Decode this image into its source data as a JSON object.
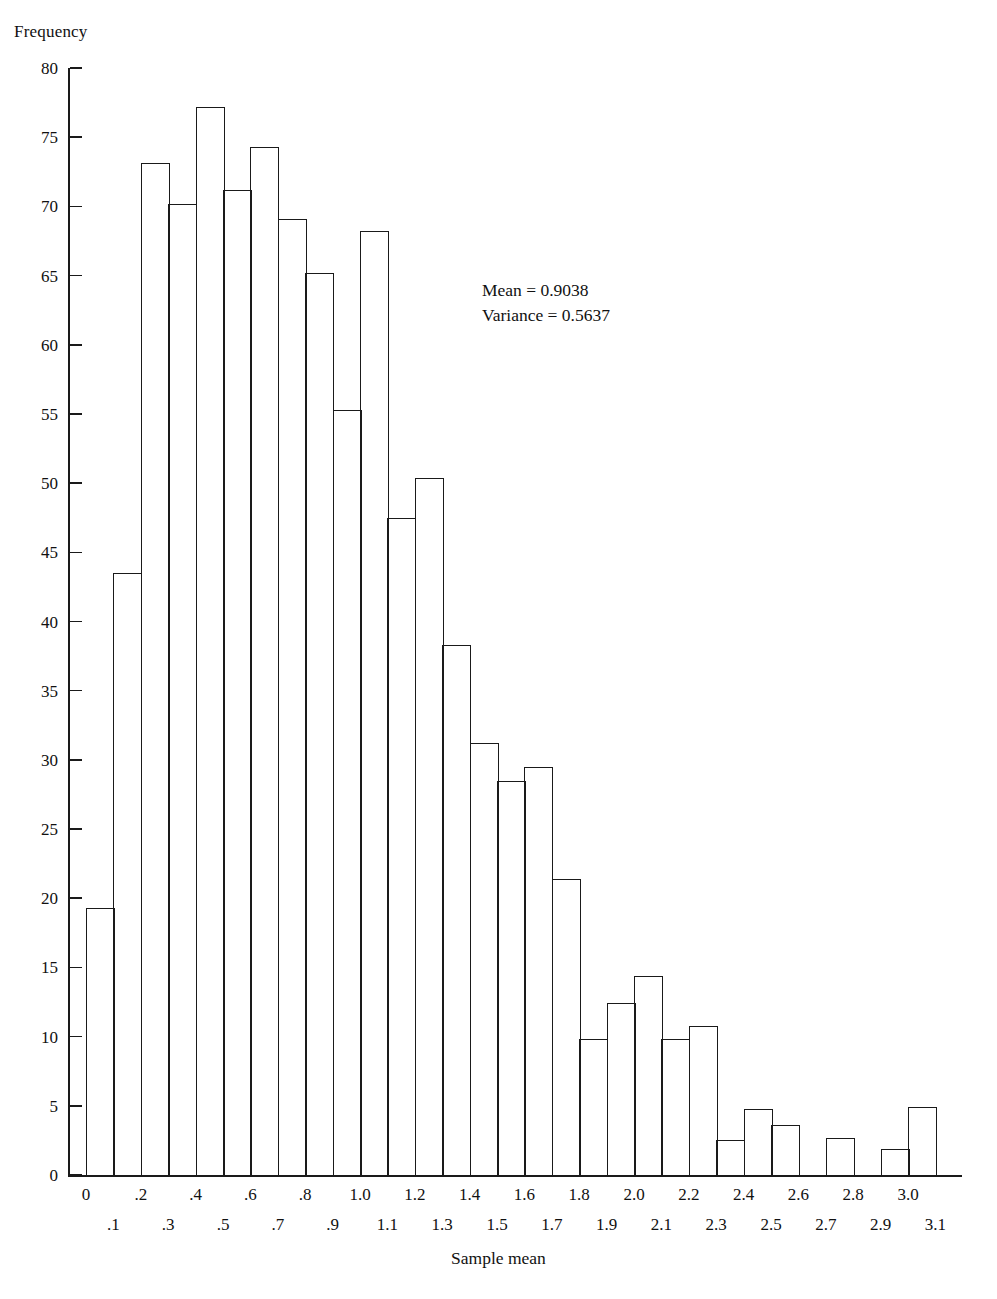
{
  "chart_data": {
    "type": "bar",
    "title": "",
    "subtitle": "",
    "xlabel": "Sample mean",
    "ylabel": "Frequency",
    "grid": false,
    "legend": null,
    "xlim": [
      0,
      3.2
    ],
    "ylim": [
      0,
      80
    ],
    "bin_width": 0.1,
    "xtick_labels": [
      "0",
      ".1",
      ".2",
      ".3",
      ".4",
      ".5",
      ".6",
      ".7",
      ".8",
      ".9",
      "1.0",
      "1.1",
      "1.2",
      "1.3",
      "1.4",
      "1.5",
      "1.6",
      "1.7",
      "1.8",
      "1.9",
      "2.0",
      "2.1",
      "2.2",
      "2.3",
      "2.4",
      "2.5",
      "2.6",
      "2.7",
      "2.8",
      "2.9",
      "3.0",
      "3.1"
    ],
    "ytick_labels": [
      "0",
      "5",
      "10",
      "15",
      "20",
      "25",
      "30",
      "35",
      "40",
      "45",
      "50",
      "55",
      "60",
      "65",
      "70",
      "75",
      "80"
    ],
    "ytick_values": [
      0,
      5,
      10,
      15,
      20,
      25,
      30,
      35,
      40,
      45,
      50,
      55,
      60,
      65,
      70,
      75,
      80
    ],
    "categories": [
      "0-.1",
      ".1-.2",
      ".2-.3",
      ".3-.4",
      ".4-.5",
      ".5-.6",
      ".6-.7",
      ".7-.8",
      ".8-.9",
      ".9-1.0",
      "1.0-1.1",
      "1.1-1.2",
      "1.2-1.3",
      "1.3-1.4",
      "1.4-1.5",
      "1.5-1.6",
      "1.6-1.7",
      "1.7-1.8",
      "1.8-1.9",
      "1.9-2.0",
      "2.0-2.1",
      "2.1-2.2",
      "2.2-2.3",
      "2.3-2.4",
      "2.4-2.5",
      "2.5-2.6",
      "2.6-2.7",
      "2.7-2.8",
      "2.8-2.9",
      "2.9-3.0",
      "3.0-3.1"
    ],
    "bin_starts": [
      0,
      0.1,
      0.2,
      0.3,
      0.4,
      0.5,
      0.6,
      0.7,
      0.8,
      0.9,
      1.0,
      1.1,
      1.2,
      1.3,
      1.4,
      1.5,
      1.6,
      1.7,
      1.8,
      1.9,
      2.0,
      2.1,
      2.2,
      2.3,
      2.4,
      2.5,
      2.6,
      2.7,
      2.8,
      2.9,
      3.0
    ],
    "values": [
      19.3,
      43.5,
      73.1,
      70.2,
      77.2,
      71.2,
      74.3,
      69.1,
      65.2,
      55.3,
      68.2,
      47.5,
      50.4,
      38.3,
      31.2,
      28.5,
      29.5,
      21.4,
      9.8,
      12.4,
      14.4,
      9.8,
      10.8,
      2.5,
      4.8,
      3.6,
      0,
      2.7,
      0,
      1.9,
      4.9
    ],
    "annotations": {
      "mean_line": "Mean = 0.9038",
      "variance_line": "Variance = 0.5637",
      "mean": 0.9038,
      "variance": 0.5637
    },
    "style": {
      "bar_fill": "none",
      "bar_stroke": "#1a1a1a",
      "axis_color": "#1a1a1a",
      "background": "#ffffff"
    }
  }
}
